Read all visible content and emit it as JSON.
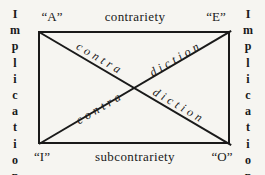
{
  "colors": {
    "paper": "#f6f5f1",
    "ink": "#1a1a1a"
  },
  "square": {
    "corner_top_left": "“A”",
    "corner_top_right": "“E”",
    "corner_bottom_left": "“I”",
    "corner_bottom_right": "“O”",
    "top_edge": "contrariety",
    "bottom_edge": "subcontrariety",
    "left_edge": "Implication",
    "right_edge": "Implication",
    "diagonal_ao_part1": "contra",
    "diagonal_ao_part2": "diction",
    "diagonal_ie_part1": "contra",
    "diagonal_ie_part2": "diction"
  }
}
